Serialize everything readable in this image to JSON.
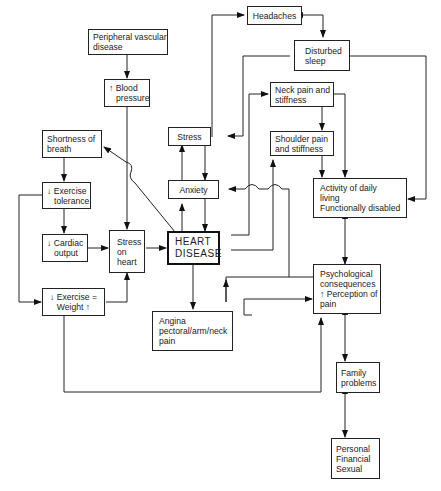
{
  "diagram": {
    "title": "",
    "nodes": {
      "peripheral_vascular": {
        "lines": [
          "Peripheral vascular",
          "disease"
        ]
      },
      "blood_pressure": {
        "lines": [
          "↑ Blood",
          "pressure"
        ]
      },
      "headaches": {
        "lines": [
          "Headaches"
        ]
      },
      "disturbed_sleep": {
        "lines": [
          "Disturbed",
          "sleep"
        ]
      },
      "neck_pain": {
        "lines": [
          "Neck pain and",
          "stiffness"
        ]
      },
      "shoulder_pain": {
        "lines": [
          "Shoulder pain",
          "and stiffness"
        ]
      },
      "stress": {
        "lines": [
          "Stress"
        ]
      },
      "shortness_breath": {
        "lines": [
          "Shortness of",
          "breath"
        ]
      },
      "anxiety": {
        "lines": [
          "Anxiety"
        ]
      },
      "exercise_tolerance": {
        "lines": [
          "↓ Exercise",
          "tolerance"
        ]
      },
      "cardiac_output": {
        "lines": [
          "↓ Cardiac",
          "output"
        ]
      },
      "stress_on_heart": {
        "lines": [
          "Stress",
          "on",
          "heart"
        ]
      },
      "heart_disease": {
        "lines": [
          "HEART",
          "DISEASE"
        ]
      },
      "activity_daily_living": {
        "lines": [
          "Activity of daily",
          "living",
          "Functionally disabled"
        ]
      },
      "exercise_weight": {
        "lines": [
          "↓ Exercise =",
          "Weight ↑"
        ]
      },
      "angina": {
        "lines": [
          "Angina",
          "pectoral/arm/neck",
          "pain"
        ]
      },
      "psychological": {
        "lines": [
          "Psychological",
          "consequences",
          "↑ Perception of",
          "pain"
        ]
      },
      "family_problems": {
        "lines": [
          "Family",
          "problems"
        ]
      },
      "personal": {
        "lines": [
          "Personal",
          "Financial",
          "Sexual"
        ]
      }
    },
    "edges": [
      {
        "from": "Peripheral vascular disease",
        "to": "↑ Blood pressure"
      },
      {
        "from": "↑ Blood pressure",
        "to": "Stress on heart"
      },
      {
        "from": "Shortness of breath",
        "to": "↓ Exercise tolerance"
      },
      {
        "from": "↓ Exercise tolerance",
        "to": "↓ Cardiac output"
      },
      {
        "from": "↓ Exercise tolerance",
        "to": "↓ Exercise = Weight ↑"
      },
      {
        "from": "↓ Cardiac output",
        "to": "Stress on heart"
      },
      {
        "from": "↓ Exercise = Weight ↑",
        "to": "Stress on heart"
      },
      {
        "from": "↓ Exercise = Weight ↑",
        "to": "Psychological consequences"
      },
      {
        "from": "Stress on heart",
        "to": "HEART DISEASE"
      },
      {
        "from": "HEART DISEASE",
        "to": "Shortness of breath"
      },
      {
        "from": "HEART DISEASE",
        "to": "Anxiety"
      },
      {
        "from": "Anxiety",
        "to": "Stress"
      },
      {
        "from": "Stress",
        "to": "Anxiety"
      },
      {
        "from": "Anxiety",
        "to": "HEART DISEASE"
      },
      {
        "from": "HEART DISEASE",
        "to": "Angina pectoral/arm/neck pain"
      },
      {
        "from": "HEART DISEASE",
        "to": "Neck pain and stiffness"
      },
      {
        "from": "HEART DISEASE",
        "to": "Shoulder pain and stiffness"
      },
      {
        "from": "Stress",
        "to": "Headaches"
      },
      {
        "from": "Headaches",
        "to": "Disturbed sleep",
        "bidirectional": true
      },
      {
        "from": "Disturbed sleep",
        "to": "Stress"
      },
      {
        "from": "Disturbed sleep",
        "to": "Activity of daily living"
      },
      {
        "from": "Neck pain and stiffness",
        "to": "Shoulder pain and stiffness"
      },
      {
        "from": "Neck pain and stiffness",
        "to": "Activity of daily living"
      },
      {
        "from": "Shoulder pain and stiffness",
        "to": "Activity of daily living"
      },
      {
        "from": "Activity of daily living",
        "to": "Psychological consequences",
        "bidirectional": true
      },
      {
        "from": "Psychological consequences",
        "to": "Anxiety"
      },
      {
        "from": "Angina pectoral/arm/neck pain",
        "to": "Psychological consequences"
      },
      {
        "from": "Psychological consequences",
        "to": "Family problems",
        "bidirectional": true
      },
      {
        "from": "Family problems",
        "to": "Personal Financial Sexual",
        "bidirectional": true
      }
    ]
  }
}
